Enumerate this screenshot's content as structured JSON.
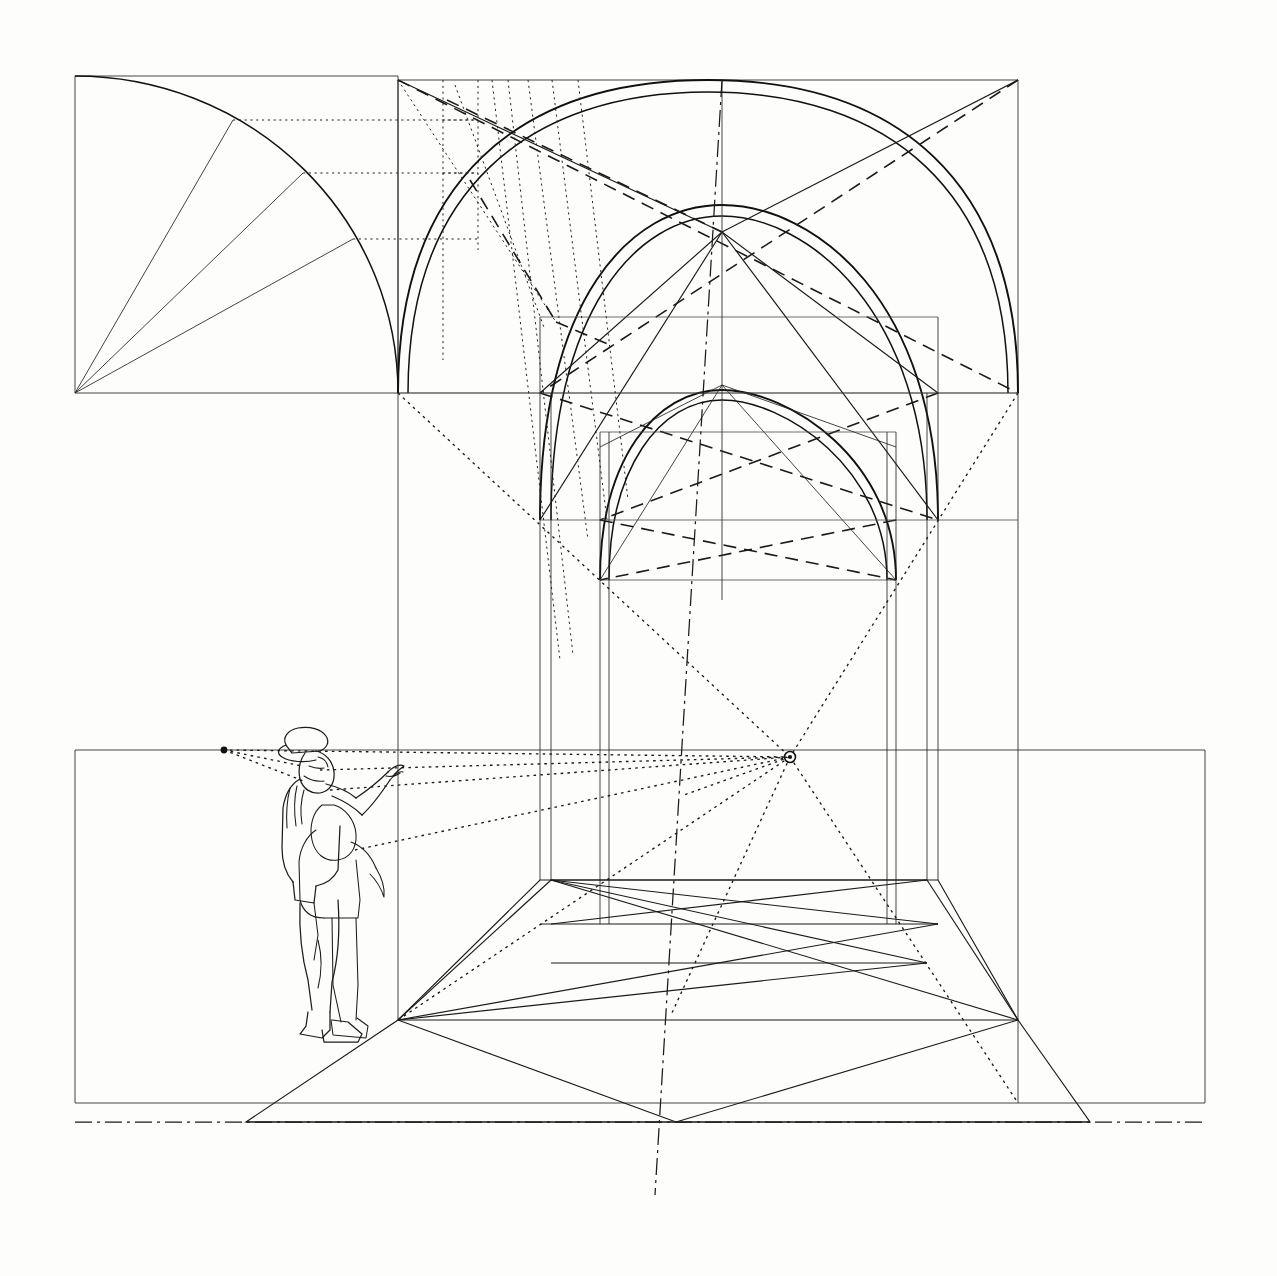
{
  "document": {
    "title": "Perspective construction of a groin-vaulted bay",
    "medium": "ink line drawing",
    "background_color": "#fdfdfc",
    "ink_color": "#1a1a1a",
    "width": 1277,
    "height": 1276
  },
  "chart_data": {
    "type": "diagram",
    "subtitle": "Quarter-circle arch divider, picture-plane elevation and receding floor grid",
    "xlabel": "",
    "ylabel": "",
    "grid": false,
    "legend_position": "none",
    "annotations": [
      "vanishing point",
      "horizon line",
      "ground line",
      "centre axis",
      "quarter-circle arch template",
      "diagonal vault ribs"
    ],
    "key_points": [
      {
        "name": "vanishing-point",
        "x": 790,
        "y": 757
      },
      {
        "name": "measuring-point",
        "x": 224,
        "y": 750
      },
      {
        "name": "crown-of-front-arch",
        "x": 722,
        "y": 232
      },
      {
        "name": "floor-apex",
        "x": 676,
        "y": 1122
      }
    ],
    "series": [
      {
        "name": "quarter-circle-construction",
        "values": [
          {
            "label": "arc-origin",
            "x": 75,
            "y": 393
          },
          {
            "label": "arc-start",
            "x": 75,
            "y": 76
          },
          {
            "label": "arc-end",
            "x": 398,
            "y": 393
          },
          {
            "label": "radial-1",
            "x": 233,
            "y": 120
          },
          {
            "label": "radial-2",
            "x": 300,
            "y": 173
          },
          {
            "label": "radial-3",
            "x": 352,
            "y": 240
          }
        ]
      },
      {
        "name": "elevation-frame",
        "values": [
          {
            "label": "top-left",
            "x": 398,
            "y": 80
          },
          {
            "label": "top-right",
            "x": 1018,
            "y": 80
          },
          {
            "label": "springing-left",
            "x": 398,
            "y": 393
          },
          {
            "label": "springing-right",
            "x": 1018,
            "y": 393
          }
        ]
      },
      {
        "name": "floor-grid-rows",
        "values": [
          {
            "label": "row-1-y",
            "x": 0,
            "y": 880
          },
          {
            "label": "row-2-y",
            "x": 0,
            "y": 924
          },
          {
            "label": "row-3-y",
            "x": 0,
            "y": 963
          },
          {
            "label": "row-4-y",
            "x": 0,
            "y": 1019
          },
          {
            "label": "front-edge-y",
            "x": 0,
            "y": 1122
          }
        ]
      }
    ]
  },
  "elements": {
    "left_panel": {
      "name": "quarter-circle arc construction panel",
      "bounds": {
        "x": 75,
        "y": 76,
        "width": 323,
        "height": 317
      },
      "radials": 3,
      "projector_lines": 3
    },
    "elevation": {
      "name": "front elevation of vaulted bay",
      "bounds": {
        "x": 398,
        "y": 80,
        "width": 620,
        "height": 1030
      },
      "arch_count": 3,
      "rib_pairs": 2
    },
    "floor": {
      "name": "receding floor plan with diagonal grid",
      "bounds": {
        "x": 75,
        "y": 750,
        "width": 1130,
        "height": 353
      },
      "bay_rows": 4
    },
    "figures": {
      "name": "two standing human figures for scale",
      "count": 2,
      "pose": "front figure points toward the vanishing point"
    },
    "vanishing_point": {
      "name": "vanishing point marker",
      "x": 790,
      "y": 757,
      "radius": 5
    }
  }
}
